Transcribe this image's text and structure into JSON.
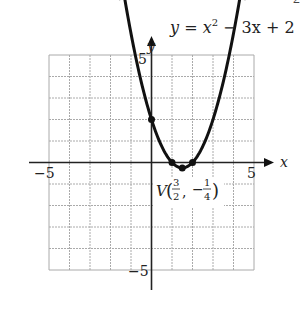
{
  "chart_data": {
    "type": "line",
    "equation": {
      "lhs": "y",
      "eq": " = ",
      "x": "x",
      "sup": "2",
      "rest": " − 3x + 2"
    },
    "xlabel": "x",
    "ylabel": "y",
    "xlim": [
      -5,
      5
    ],
    "ylim": [
      -5,
      5
    ],
    "grid": true,
    "tick_labels": {
      "x_min": "−5",
      "x_max": "5",
      "y_max": "5",
      "y_min": "−5"
    },
    "function": {
      "a": 1,
      "b": -3,
      "c": 2
    },
    "curve_x_range": [
      -1.3,
      4.3
    ],
    "points": [
      {
        "x": 0,
        "y": 2,
        "label": "y-intercept"
      },
      {
        "x": 1,
        "y": 0,
        "label": "root"
      },
      {
        "x": 2,
        "y": 0,
        "label": "root"
      },
      {
        "x": 1.5,
        "y": -0.25,
        "label": "vertex"
      }
    ],
    "vertex_label": {
      "prefix": "V",
      "x_num": "3",
      "x_den": "2",
      "y_sign": "−",
      "y_num": "1",
      "y_den": "4"
    }
  },
  "page_corner_text": "2"
}
